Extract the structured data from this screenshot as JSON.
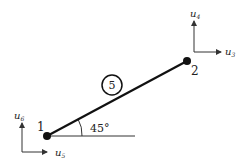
{
  "diagram": {
    "type": "truss element",
    "element": {
      "id": "5",
      "angle_label": "45°"
    },
    "nodes": [
      {
        "id": "1",
        "label": "1",
        "dofs": {
          "horizontal": "u5",
          "vertical": "u6"
        }
      },
      {
        "id": "2",
        "label": "2",
        "dofs": {
          "horizontal": "u3",
          "vertical": "u4"
        }
      }
    ],
    "labels": {
      "u3_base": "u",
      "u3_sub": "3",
      "u4_base": "u",
      "u4_sub": "4",
      "u5_base": "u",
      "u5_sub": "5",
      "u6_base": "u",
      "u6_sub": "6",
      "node1": "1",
      "node2": "2",
      "element": "5",
      "angle": "45°"
    },
    "colors": {
      "line": "#111111",
      "text": "#222222",
      "arrow": "#333333"
    }
  }
}
